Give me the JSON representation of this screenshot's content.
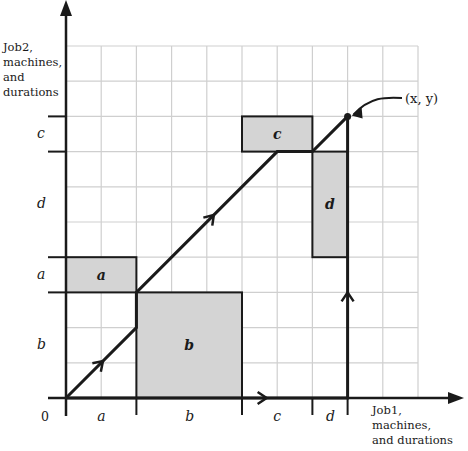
{
  "diagram": {
    "type": "job-shop geometric schedule (two-job Gantt path)",
    "origin_label": "0",
    "x_axis_title": [
      "Job1,",
      "machines,",
      "and durations"
    ],
    "y_axis_title": [
      "Job2,",
      "machines,",
      "and",
      "durations"
    ],
    "endpoint_label": "(x, y)",
    "x_segments": [
      {
        "label": "a",
        "from": 0,
        "to": 2
      },
      {
        "label": "b",
        "from": 2,
        "to": 5
      },
      {
        "label": "c",
        "from": 5,
        "to": 7
      },
      {
        "label": "d",
        "from": 7,
        "to": 8
      }
    ],
    "y_segments": [
      {
        "label": "b",
        "from": 0,
        "to": 3
      },
      {
        "label": "a",
        "from": 3,
        "to": 4
      },
      {
        "label": "d",
        "from": 4,
        "to": 7
      },
      {
        "label": "c",
        "from": 7,
        "to": 8
      }
    ],
    "blocked_regions": [
      {
        "label": "a",
        "x": [
          0,
          2
        ],
        "y": [
          3,
          4
        ]
      },
      {
        "label": "b",
        "x": [
          2,
          5
        ],
        "y": [
          0,
          3
        ]
      },
      {
        "label": "c",
        "x": [
          5,
          7
        ],
        "y": [
          7,
          8
        ]
      },
      {
        "label": "d",
        "x": [
          7,
          8
        ],
        "y": [
          4,
          7
        ]
      }
    ],
    "paths": [
      {
        "name": "path-1",
        "points": [
          [
            0,
            0
          ],
          [
            2,
            2
          ],
          [
            2,
            3
          ],
          [
            6,
            7
          ],
          [
            7,
            7
          ],
          [
            8,
            8
          ]
        ]
      },
      {
        "name": "path-2",
        "points": [
          [
            0,
            0
          ],
          [
            8,
            0
          ],
          [
            8,
            8
          ]
        ]
      }
    ],
    "grid": {
      "cols": 10,
      "rows": 10
    },
    "colors": {
      "block_fill": "#d4d4d4",
      "grid": "#cfcfcf",
      "stroke": "#1a1a1a"
    }
  }
}
